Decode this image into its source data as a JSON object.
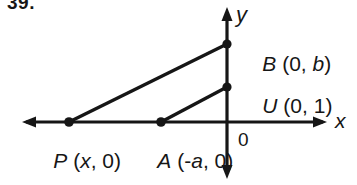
{
  "figure": {
    "problem_number": "39.",
    "background_color": "#ffffff",
    "ink_color": "#161616",
    "axes": {
      "x_axis_label": "x",
      "y_axis_label": "y",
      "origin_label": "0",
      "origin_px": {
        "x": 227,
        "y": 122
      },
      "x_axis_extent_px": {
        "from": 22,
        "to": 327,
        "y": 122
      },
      "y_axis_extent_px": {
        "from": 8,
        "to": 178,
        "x": 227
      },
      "arrowheads": [
        "left",
        "right",
        "up",
        "down"
      ]
    },
    "points": [
      {
        "id": "B",
        "name": "B",
        "coordinates": "(0, b)",
        "label": "B (0, b)",
        "px": {
          "x": 227,
          "y": 44
        },
        "on_axis": "y"
      },
      {
        "id": "U",
        "name": "U",
        "coordinates": "(0, 1)",
        "label": "U (0, 1)",
        "px": {
          "x": 227,
          "y": 87
        },
        "on_axis": "y"
      },
      {
        "id": "P",
        "name": "P",
        "coordinates": "(x, 0)",
        "label": "P (x, 0)",
        "px": {
          "x": 69,
          "y": 122
        },
        "on_axis": "x"
      },
      {
        "id": "A",
        "name": "A",
        "coordinates": "(-a, 0)",
        "label": "A (-a, 0)",
        "px": {
          "x": 161,
          "y": 122
        },
        "on_axis": "x"
      }
    ],
    "segments": [
      {
        "id": "PB",
        "from": "P",
        "to": "B"
      },
      {
        "id": "AU",
        "from": "A",
        "to": "U"
      }
    ],
    "label_parts": {
      "b": {
        "point": "B",
        "open": " (0, ",
        "var": "b",
        "close": ")"
      },
      "u": {
        "point": "U",
        "open": " (0, ",
        "var": "1",
        "close": ")"
      },
      "p": {
        "point": "P",
        "open": " (",
        "var": "x",
        "close": ", 0)"
      },
      "a": {
        "point": "A",
        "open": " (-",
        "var": "a",
        "close": ", 0)"
      }
    }
  }
}
